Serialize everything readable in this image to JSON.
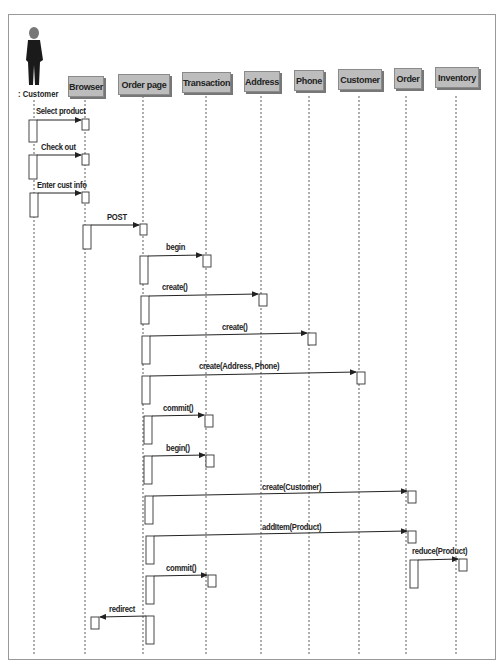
{
  "diagram": {
    "type": "UML sequence diagram",
    "actor": {
      "label": ": Customer"
    },
    "lifelines": [
      {
        "id": "browser",
        "label": "Browser"
      },
      {
        "id": "order_page",
        "label": "Order page"
      },
      {
        "id": "transaction",
        "label": "Transaction"
      },
      {
        "id": "address",
        "label": "Address"
      },
      {
        "id": "phone",
        "label": "Phone"
      },
      {
        "id": "customer",
        "label": "Customer"
      },
      {
        "id": "order",
        "label": "Order"
      },
      {
        "id": "inventory",
        "label": "Inventory"
      }
    ],
    "messages": [
      {
        "from": "actor",
        "to": "browser",
        "label": "Select product"
      },
      {
        "from": "actor",
        "to": "browser",
        "label": "Check out"
      },
      {
        "from": "actor",
        "to": "browser",
        "label": "Enter cust info"
      },
      {
        "from": "browser",
        "to": "order_page",
        "label": "POST"
      },
      {
        "from": "order_page",
        "to": "transaction",
        "label": "begin"
      },
      {
        "from": "order_page",
        "to": "address",
        "label": "create()"
      },
      {
        "from": "order_page",
        "to": "phone",
        "label": "create()"
      },
      {
        "from": "order_page",
        "to": "customer",
        "label": "create(Address, Phone)"
      },
      {
        "from": "order_page",
        "to": "transaction",
        "label": "commit()"
      },
      {
        "from": "order_page",
        "to": "transaction",
        "label": "begin()"
      },
      {
        "from": "order_page",
        "to": "order",
        "label": "create(Customer)"
      },
      {
        "from": "order_page",
        "to": "order",
        "label": "addItem(Product)"
      },
      {
        "from": "order",
        "to": "inventory",
        "label": "reduce(Product)"
      },
      {
        "from": "order_page",
        "to": "transaction",
        "label": "commit()"
      },
      {
        "from": "order_page",
        "to": "browser",
        "label": "redirect"
      }
    ]
  }
}
